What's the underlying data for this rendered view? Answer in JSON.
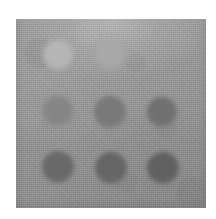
{
  "figure": {
    "image_type": "grayscale-spot-array",
    "canvas": {
      "width": 216,
      "height": 219,
      "background": "#ffffff"
    }
  },
  "substrate": {
    "name": "scan-substrate",
    "x": 16,
    "y": 19,
    "width": 190,
    "height": 189,
    "base_color": "#959595",
    "top_edge_color": "#b4b4b4",
    "bottom_edge_color": "#8d8d8d",
    "texture": "woven-grain-noise"
  },
  "grid": {
    "rows": 3,
    "columns": 3,
    "row_labels": [
      "Row 1",
      "Row 2",
      "Row 3"
    ],
    "column_labels": [
      "Col 1",
      "Col 2",
      "Col 3"
    ],
    "visible_spot_count": 8,
    "empty_positions": [
      "r1c3"
    ]
  },
  "spots": [
    {
      "id": "r1c1",
      "row": 1,
      "column": 1,
      "cx": 58,
      "cy": 55,
      "radius": 15,
      "color": "#b9b9b9",
      "edge_color": "#a8a8a8",
      "polarity": "lighter-than-background",
      "intensity": 0.22,
      "blur": 2.4,
      "visible": true
    },
    {
      "id": "r1c2",
      "row": 1,
      "column": 2,
      "cx": 110,
      "cy": 55,
      "radius": 15,
      "color": "#ababab",
      "edge_color": "#a0a0a0",
      "polarity": "lighter-than-background",
      "intensity": 0.12,
      "blur": 3.2,
      "visible": true
    },
    {
      "id": "r1c3",
      "row": 1,
      "column": 3,
      "cx": 163,
      "cy": 55,
      "radius": 15,
      "color": "#969696",
      "edge_color": "#949494",
      "polarity": "none",
      "intensity": 0.0,
      "blur": 4.0,
      "visible": false
    },
    {
      "id": "r2c1",
      "row": 2,
      "column": 1,
      "cx": 58,
      "cy": 111,
      "radius": 15,
      "color": "#858585",
      "edge_color": "#8d8d8d",
      "polarity": "darker-than-background",
      "intensity": 0.16,
      "blur": 2.6,
      "visible": true
    },
    {
      "id": "r2c2",
      "row": 2,
      "column": 2,
      "cx": 110,
      "cy": 112,
      "radius": 16,
      "color": "#787878",
      "edge_color": "#868686",
      "polarity": "darker-than-background",
      "intensity": 0.3,
      "blur": 2.2,
      "visible": true
    },
    {
      "id": "r2c3",
      "row": 2,
      "column": 3,
      "cx": 162,
      "cy": 112,
      "radius": 15,
      "color": "#6f6f6f",
      "edge_color": "#828282",
      "polarity": "darker-than-background",
      "intensity": 0.38,
      "blur": 2.0,
      "visible": true
    },
    {
      "id": "r3c1",
      "row": 3,
      "column": 1,
      "cx": 58,
      "cy": 167,
      "radius": 16,
      "color": "#676767",
      "edge_color": "#7d7d7d",
      "polarity": "darker-than-background",
      "intensity": 0.45,
      "blur": 2.0,
      "visible": true
    },
    {
      "id": "r3c2",
      "row": 3,
      "column": 2,
      "cx": 111,
      "cy": 168,
      "radius": 16,
      "color": "#636363",
      "edge_color": "#7b7b7b",
      "polarity": "darker-than-background",
      "intensity": 0.48,
      "blur": 1.9,
      "visible": true
    },
    {
      "id": "r3c3",
      "row": 3,
      "column": 3,
      "cx": 163,
      "cy": 168,
      "radius": 16,
      "color": "#5e5e5e",
      "edge_color": "#787878",
      "polarity": "darker-than-background",
      "intensity": 0.52,
      "blur": 1.9,
      "visible": true
    }
  ]
}
